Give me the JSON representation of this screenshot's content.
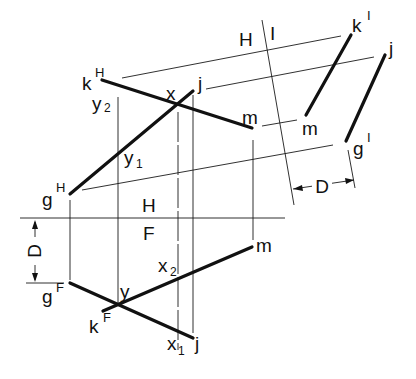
{
  "diagram": {
    "type": "descriptive-geometry-auxiliary-view",
    "fold_lines": [
      {
        "id": "H-F",
        "upper": "H",
        "lower": "F"
      },
      {
        "id": "H-I",
        "left": "H",
        "right": "I"
      }
    ],
    "views": {
      "horizontal": {
        "points": {
          "k": "k",
          "k_sup": "H",
          "j": "j",
          "m": "m",
          "g": "g",
          "g_sup": "H"
        },
        "intersections": {
          "x": "x",
          "y1": "y",
          "y1_sub": "1",
          "y2": "y",
          "y2_sub": "2"
        }
      },
      "frontal": {
        "points": {
          "g": "g",
          "g_sup": "F",
          "k": "k",
          "k_sup": "F",
          "j": "j",
          "m": "m"
        },
        "intersections": {
          "y": "y",
          "x1": "x",
          "x1_sub": "1",
          "x2": "x",
          "x2_sub": "2"
        }
      },
      "auxiliary": {
        "points": {
          "k": "k",
          "k_sup": "I",
          "j": "j",
          "m": "m",
          "g": "g",
          "g_sup": "I"
        }
      }
    },
    "dimensions": {
      "D_front": "D",
      "D_aux": "D"
    },
    "fold_labels": {
      "hf_H": "H",
      "hf_F": "F",
      "hi_H": "H",
      "hi_I": "I"
    }
  }
}
